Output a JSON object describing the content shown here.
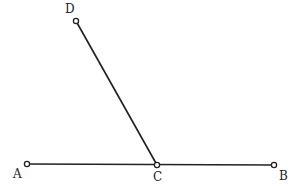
{
  "diagram": {
    "type": "geometry",
    "points": [
      {
        "id": "A",
        "label": "A",
        "x": 27,
        "y": 164,
        "lx": 14,
        "ly": 178
      },
      {
        "id": "B",
        "label": "B",
        "x": 274,
        "y": 165,
        "lx": 280,
        "ly": 180
      },
      {
        "id": "C",
        "label": "C",
        "x": 157,
        "y": 165,
        "lx": 154,
        "ly": 181
      },
      {
        "id": "D",
        "label": "D",
        "x": 76,
        "y": 21,
        "lx": 66,
        "ly": 13
      }
    ],
    "segments": [
      {
        "from": "A",
        "to": "B"
      },
      {
        "from": "C",
        "to": "D"
      }
    ],
    "labels": {
      "A": "A",
      "B": "B",
      "C": "C",
      "D": "D"
    }
  }
}
